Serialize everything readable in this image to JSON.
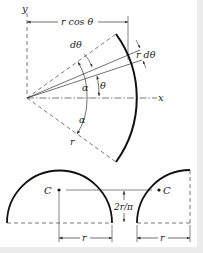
{
  "figure": {
    "top": {
      "axis_y_label": "y",
      "axis_x_label": "x",
      "dimension_top": "r cos θ",
      "label_dtheta": "dθ",
      "label_r_dtheta": "r dθ",
      "label_theta": "θ",
      "label_alpha_upper": "α",
      "label_alpha_lower": "α",
      "label_r": "r"
    },
    "bottom": {
      "left_centroid_label": "C",
      "right_centroid_label": "C",
      "height_label": "2r/π",
      "left_radius_label": "r",
      "right_radius_label": "r"
    }
  },
  "colors": {
    "ink": "#222222",
    "dashed": "#555555",
    "background": "#ffffff",
    "frame": "#ececec"
  }
}
